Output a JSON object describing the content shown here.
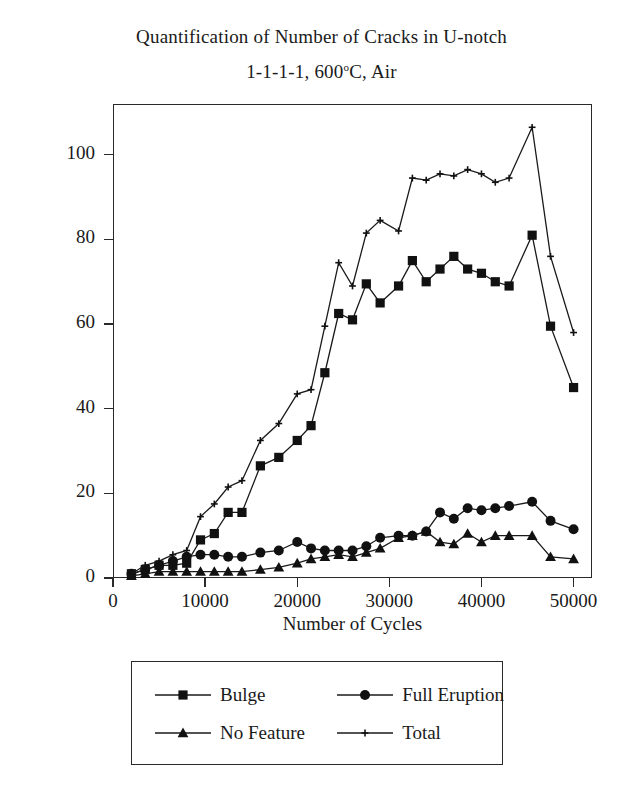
{
  "figure": {
    "title_line1": "Quantification of Number of Cracks in U-notch",
    "title_line2_pre": "1-1-1-1, 600",
    "title_line2_sup": "o",
    "title_line2_post": "C, Air"
  },
  "chart_data": {
    "type": "line",
    "xlabel": "Number of Cycles",
    "ylabel": "Number of Cracks Observed",
    "xlim": [
      0,
      52000
    ],
    "ylim": [
      0,
      112
    ],
    "xticks": [
      0,
      10000,
      20000,
      30000,
      40000,
      50000
    ],
    "xtick_labels": [
      "0",
      "10000",
      "20000",
      "30000",
      "40000",
      "50000"
    ],
    "yticks": [
      0,
      20,
      40,
      60,
      80,
      100
    ],
    "ytick_labels": [
      "0",
      "20",
      "40",
      "60",
      "80",
      "100"
    ],
    "grid": false,
    "legend_position": "below-plot",
    "x": [
      2000,
      3500,
      5000,
      6500,
      8000,
      9500,
      11000,
      12500,
      14000,
      16000,
      18000,
      20000,
      21500,
      23000,
      24500,
      26000,
      27500,
      29000,
      31000,
      32500,
      34000,
      35500,
      37000,
      38500,
      40000,
      41500,
      43000,
      45500,
      47500,
      50000
    ],
    "series": [
      {
        "name": "Bulge",
        "marker": "square",
        "values": [
          1,
          2,
          3,
          3,
          3.5,
          9,
          10.5,
          15.5,
          15.5,
          26.5,
          28.5,
          32.5,
          36,
          48.5,
          62.5,
          61,
          69.5,
          65,
          69,
          75,
          70,
          73,
          76,
          73,
          72,
          70,
          69,
          81,
          59.5,
          45
        ]
      },
      {
        "name": "Full Eruption",
        "marker": "circle",
        "values": [
          1,
          2,
          3,
          4,
          5,
          5.5,
          5.5,
          5,
          5,
          6,
          6.5,
          8.5,
          7,
          6.5,
          6.5,
          6.5,
          7.5,
          9.5,
          10,
          10,
          11,
          15.5,
          14,
          16.5,
          16,
          16.5,
          17,
          18,
          13.5,
          11.5
        ]
      },
      {
        "name": "No Feature",
        "marker": "triangle",
        "values": [
          0.5,
          1,
          1.5,
          1.5,
          1.5,
          1.5,
          1.5,
          1.5,
          1.5,
          2,
          2.5,
          3.5,
          4.5,
          5,
          5.5,
          5,
          6,
          7,
          9.5,
          10,
          11,
          8.5,
          8,
          10.5,
          8.5,
          10,
          10,
          10,
          5,
          4.5
        ]
      },
      {
        "name": "Total",
        "marker": "plus",
        "values": [
          1,
          3,
          4,
          5.5,
          6.5,
          14.5,
          17.5,
          21.5,
          23,
          32.5,
          36.5,
          43.5,
          44.5,
          59.5,
          74.5,
          69,
          81.5,
          84.5,
          82,
          94.5,
          94,
          95.5,
          95,
          96.5,
          95.5,
          93.5,
          94.5,
          106.5,
          76,
          58
        ]
      }
    ]
  },
  "legend": {
    "entries": [
      {
        "label": "Bulge",
        "marker": "square"
      },
      {
        "label": "Full Eruption",
        "marker": "circle"
      },
      {
        "label": "No Feature",
        "marker": "triangle"
      },
      {
        "label": "Total",
        "marker": "plus"
      }
    ]
  },
  "colors": {
    "line": "#1a1a1a",
    "marker": "#111111",
    "axis": "#2a2a2a",
    "background": "#ffffff"
  }
}
